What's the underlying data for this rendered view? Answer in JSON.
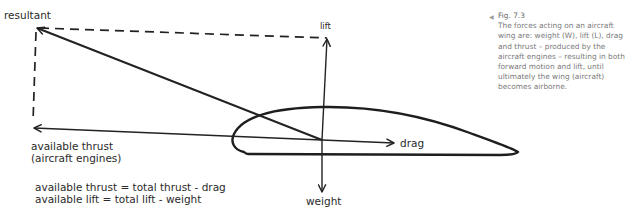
{
  "diagram": {
    "labels": {
      "resultant": "resultant",
      "lift": "lift",
      "drag": "drag",
      "weight": "weight",
      "thrust_line1": "available thrust",
      "thrust_line2": "(aircraft engines)"
    },
    "formulas": [
      "available thrust = total thrust - drag",
      "available lift = total lift - weight"
    ],
    "vectors": [
      {
        "name": "resultant",
        "style": "solid",
        "from": [
          322,
          140
        ],
        "to": [
          36,
          28
        ]
      },
      {
        "name": "lift",
        "style": "solid",
        "from": [
          322,
          140
        ],
        "to": [
          327,
          38
        ]
      },
      {
        "name": "weight",
        "style": "solid",
        "from": [
          322,
          140
        ],
        "to": [
          322,
          193
        ]
      },
      {
        "name": "drag",
        "style": "solid",
        "from": [
          322,
          140
        ],
        "to": [
          394,
          143
        ]
      },
      {
        "name": "available thrust",
        "style": "solid",
        "from": [
          322,
          140
        ],
        "to": [
          33,
          128
        ]
      },
      {
        "name": "parallelogram-top",
        "style": "dashed",
        "from": [
          36,
          28
        ],
        "to": [
          327,
          38
        ]
      },
      {
        "name": "parallelogram-left",
        "style": "dashed",
        "from": [
          36,
          28
        ],
        "to": [
          33,
          128
        ]
      }
    ],
    "shape": "airfoil (aircraft wing cross-section)",
    "stroke_color": "#222222"
  },
  "caption": {
    "marker_icon": "triangle-left-icon",
    "marker_glyph": "◀",
    "figure_number": "Fig. 7.3",
    "text": "The forces acting on an aircraft wing are: weight (W), lift (L), drag and thrust – produced by the aircraft engines – resulting in both forward motion and lift, until ultimately the wing (aircraft) becomes airborne."
  }
}
